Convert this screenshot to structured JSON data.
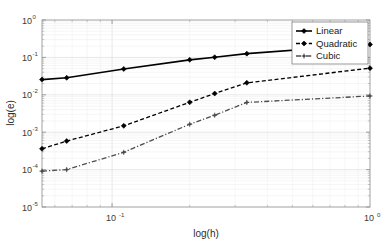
{
  "chart_data": {
    "type": "line",
    "title": "",
    "xlabel": "log(h)",
    "ylabel": "log(e)",
    "xscale": "log",
    "yscale": "log",
    "xlim": [
      0.0535,
      1.0
    ],
    "ylim": [
      1e-05,
      1.0
    ],
    "grid": true,
    "legend_position": "top-right",
    "x_tick_labels": [
      "10^-1",
      "10^0"
    ],
    "x_tick_values": [
      0.1,
      1.0
    ],
    "y_tick_labels": [
      "10^0",
      "10^-1",
      "10^-2",
      "10^-3",
      "10^-4",
      "10^-5"
    ],
    "y_tick_values": [
      1.0,
      0.1,
      0.01,
      0.001,
      0.0001,
      1e-05
    ],
    "x": [
      0.0535,
      0.0667,
      0.111,
      0.2,
      0.25,
      0.333,
      1.0
    ],
    "series": [
      {
        "name": "Linear",
        "style": "solid",
        "marker": "diamond",
        "color": "#000000",
        "values": [
          0.0255,
          0.0285,
          0.049,
          0.086,
          0.101,
          0.126,
          0.222
        ]
      },
      {
        "name": "Quadratic",
        "style": "dashed",
        "marker": "diamond",
        "color": "#000000",
        "values": [
          0.00036,
          0.00058,
          0.00148,
          0.0063,
          0.0108,
          0.0209,
          0.0515
        ]
      },
      {
        "name": "Cubic",
        "style": "dashdot",
        "marker": "plus-diamond",
        "color": "#4d4d4d",
        "values": [
          9.1e-05,
          0.0001,
          0.00029,
          0.00163,
          0.00285,
          0.00625,
          0.0093
        ]
      }
    ]
  },
  "axes": {
    "xlabel": "log(h)",
    "ylabel": "log(e)",
    "x_ticks": [
      {
        "mantissa": "10",
        "exponent": "-1"
      },
      {
        "mantissa": "10",
        "exponent": "0"
      }
    ],
    "y_ticks": [
      {
        "mantissa": "10",
        "exponent": "0"
      },
      {
        "mantissa": "10",
        "exponent": "-1"
      },
      {
        "mantissa": "10",
        "exponent": "-2"
      },
      {
        "mantissa": "10",
        "exponent": "-3"
      },
      {
        "mantissa": "10",
        "exponent": "-4"
      },
      {
        "mantissa": "10",
        "exponent": "-5"
      }
    ]
  },
  "legend": {
    "entries": [
      {
        "label": "Linear"
      },
      {
        "label": "Quadratic"
      },
      {
        "label": "Cubic"
      }
    ]
  },
  "colors": {
    "background": "#ffffff",
    "axis": "#8a8a8a",
    "grid_major": "#d6d6d6",
    "grid_minor": "#ededed",
    "series_primary": "#000000",
    "series_cubic": "#4d4d4d"
  }
}
